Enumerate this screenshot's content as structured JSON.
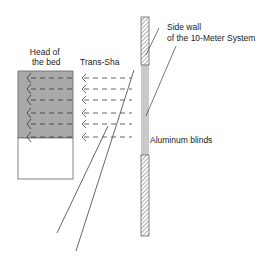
{
  "labels": {
    "head_of_bed_line1": "Head of",
    "head_of_bed_line2": "the bed",
    "trans_sha": "Trans-Sha",
    "side_wall_line1": "Side wall",
    "side_wall_line2": "of the 10-Meter System",
    "aluminum_blinds": "Aluminum blinds"
  },
  "colors": {
    "bed_shade": "#a9a9a9",
    "line": "#555555",
    "wall_hatch": "#777777"
  },
  "diagram": {
    "bed_arrow_rows": 6,
    "light_arrow_rows": 6
  }
}
